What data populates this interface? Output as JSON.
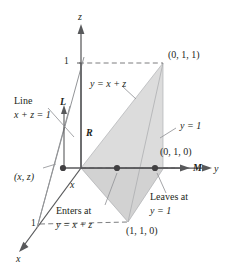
{
  "figure": {
    "colors": {
      "ink": "#231f20",
      "axis": "#58595b",
      "shade_fill": "#d9d9d9",
      "shade_edge": "#a7a9ac",
      "dashed": "#6d6e71",
      "ray": "#808285"
    },
    "axes": {
      "z_label": "z",
      "y_label": "y",
      "x_label": "x"
    },
    "ticks": {
      "z_one": "1",
      "x_one": "1"
    },
    "points": {
      "top_right": "(0, 1, 1)",
      "mid_right": "(0, 1, 0)",
      "bottom": "(1, 1, 0)",
      "xz_point": "(x, z)"
    },
    "labels": {
      "line_text": "Line",
      "line_eq": "x + z = 1",
      "plane_eq": "y = x + z",
      "wall_eq": "y = 1",
      "segment_L": "L",
      "segment_R": "R",
      "segment_M": "M",
      "x_small": "x",
      "enters_at": "Enters at",
      "enters_eq": "y = x + z",
      "leaves_at": "Leaves at",
      "leaves_eq": "y = 1"
    }
  }
}
